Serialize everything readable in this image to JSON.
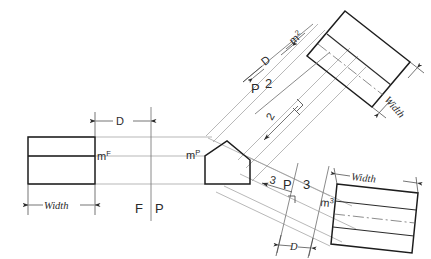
{
  "diagram": {
    "colors": {
      "object_line": "#1d1d1d",
      "projection_line": "#9a9a9a",
      "fold_line": "#7d7d7d",
      "dimension_line": "#3a3a3a",
      "center_line": "#5a5a5a",
      "background": "#ffffff"
    }
  },
  "labels": {
    "m_front": "m",
    "m_front_sup": "F",
    "m_profile": "m",
    "m_profile_sup": "P",
    "m_aux2": "m",
    "m_aux2_sup": "2",
    "m_aux3": "m",
    "m_aux3_sup": "3",
    "fold_f": "F",
    "fold_p_left": "P",
    "fold_p_upper": "P",
    "fold_2": "2",
    "fold_p_lower": "P",
    "fold_3": "3",
    "dim_d_left": "D",
    "dim_d_upper": "D",
    "dim_d_lower": "D",
    "dim_width_left": "Width",
    "dim_width_upper": "Width",
    "dim_width_lower": "Width",
    "dir_arrow_2": "2",
    "dir_arrow_3": "3"
  },
  "views": {
    "front": {
      "name": "front-view-rectangle",
      "label": "m",
      "superscript": "F",
      "dimension": "Width"
    },
    "profile": {
      "name": "profile-view-pentagon",
      "label": "m",
      "superscript": "P"
    },
    "aux2": {
      "name": "auxiliary-view-2-rectangle",
      "label": "m",
      "superscript": "2",
      "dimension": "Width",
      "offset": "D"
    },
    "aux3": {
      "name": "auxiliary-view-3-rectangle",
      "label": "m",
      "superscript": "3",
      "dimension": "Width",
      "offset": "D"
    }
  }
}
